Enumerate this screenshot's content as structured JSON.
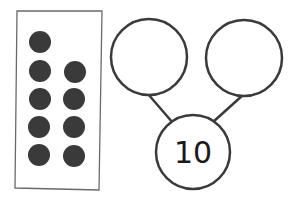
{
  "ten_frame": {
    "dots": [
      {
        "cx": 40,
        "cy": 42
      },
      {
        "cx": 40,
        "cy": 71
      },
      {
        "cx": 75,
        "cy": 72
      },
      {
        "cx": 40,
        "cy": 99
      },
      {
        "cx": 74,
        "cy": 99
      },
      {
        "cx": 39,
        "cy": 127
      },
      {
        "cx": 74,
        "cy": 127
      },
      {
        "cx": 39,
        "cy": 155
      },
      {
        "cx": 74,
        "cy": 156
      }
    ],
    "dot_count": 9,
    "dot_color": "#3a3a3a"
  },
  "number_bond": {
    "whole": "10",
    "part_left": "",
    "part_right": "",
    "stroke_color": "#3a3a3a"
  }
}
